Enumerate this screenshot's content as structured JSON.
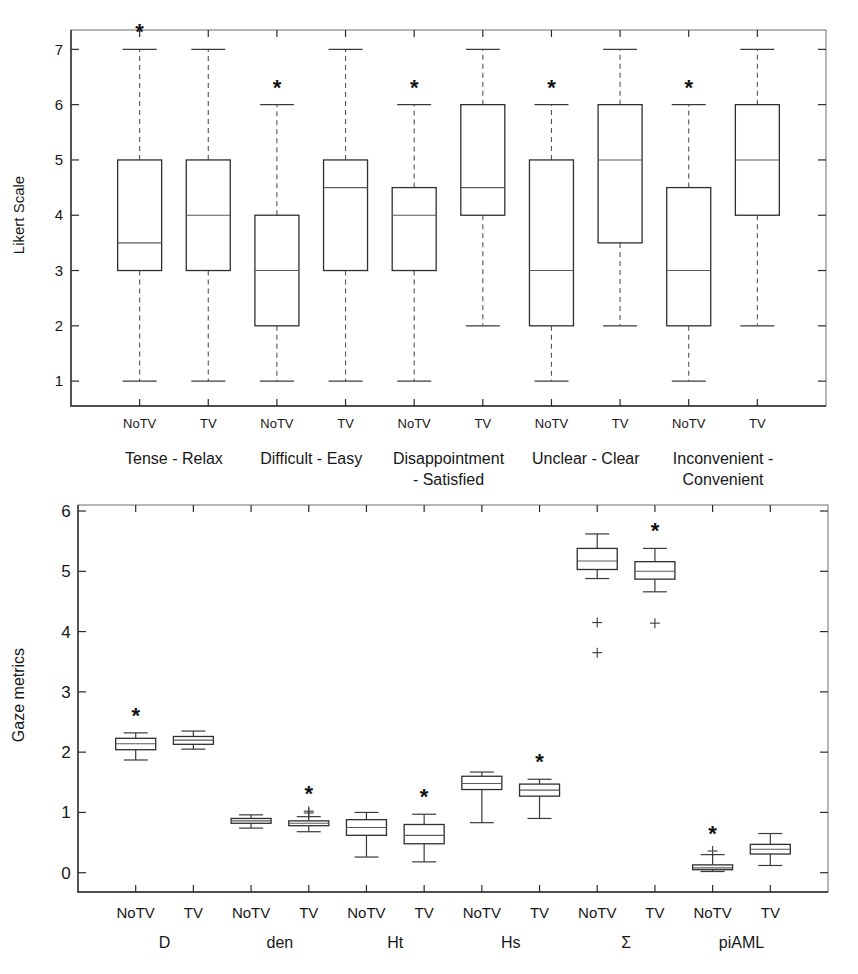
{
  "chart_data": [
    {
      "id": "likert-boxplot",
      "type": "box",
      "title": "",
      "xlabel": "",
      "ylabel": "Likert Scale",
      "ylim": [
        0.55,
        7.35
      ],
      "yticks": [
        1,
        2,
        3,
        4,
        5,
        6,
        7
      ],
      "ytick_labels": [
        "1",
        "2",
        "3",
        "4",
        "5",
        "6",
        "7"
      ],
      "grid": false,
      "legend": "none",
      "condition_labels": [
        "NoTV",
        "TV"
      ],
      "groups": [
        {
          "name": "Tense - Relax",
          "label_lines": [
            "Tense - Relax"
          ],
          "boxes": [
            {
              "condition": "NoTV",
              "whisker_low": 1,
              "q1": 3,
              "median": 3.5,
              "q3": 5,
              "whisker_high": 7,
              "outliers": [],
              "significant": true
            },
            {
              "condition": "TV",
              "whisker_low": 1,
              "q1": 3,
              "median": 4,
              "q3": 5,
              "whisker_high": 7,
              "outliers": [],
              "significant": false
            }
          ]
        },
        {
          "name": "Difficult - Easy",
          "label_lines": [
            "Difficult - Easy"
          ],
          "boxes": [
            {
              "condition": "NoTV",
              "whisker_low": 1,
              "q1": 2,
              "median": 3,
              "q3": 4,
              "whisker_high": 6,
              "outliers": [],
              "significant": true
            },
            {
              "condition": "TV",
              "whisker_low": 1,
              "q1": 3,
              "median": 4.5,
              "q3": 5,
              "whisker_high": 7,
              "outliers": [],
              "significant": false
            }
          ]
        },
        {
          "name": "Disappointment - Satisfied",
          "label_lines": [
            "Disappointment",
            "- Satisfied"
          ],
          "boxes": [
            {
              "condition": "NoTV",
              "whisker_low": 1,
              "q1": 3,
              "median": 4,
              "q3": 4.5,
              "whisker_high": 6,
              "outliers": [],
              "significant": true
            },
            {
              "condition": "TV",
              "whisker_low": 2,
              "q1": 4,
              "median": 4.5,
              "q3": 6,
              "whisker_high": 7,
              "outliers": [],
              "significant": false
            }
          ]
        },
        {
          "name": "Unclear - Clear",
          "label_lines": [
            "Unclear - Clear"
          ],
          "boxes": [
            {
              "condition": "NoTV",
              "whisker_low": 1,
              "q1": 2,
              "median": 3,
              "q3": 5,
              "whisker_high": 6,
              "outliers": [],
              "significant": true
            },
            {
              "condition": "TV",
              "whisker_low": 2,
              "q1": 3.5,
              "median": 5,
              "q3": 6,
              "whisker_high": 7,
              "outliers": [],
              "significant": false
            }
          ]
        },
        {
          "name": "Inconvenient - Convenient",
          "label_lines": [
            "Inconvenient -",
            "Convenient"
          ],
          "boxes": [
            {
              "condition": "NoTV",
              "whisker_low": 1,
              "q1": 2,
              "median": 3,
              "q3": 4.5,
              "whisker_high": 6,
              "outliers": [],
              "significant": true
            },
            {
              "condition": "TV",
              "whisker_low": 2,
              "q1": 4,
              "median": 5,
              "q3": 6,
              "whisker_high": 7,
              "outliers": [],
              "significant": false
            }
          ]
        }
      ]
    },
    {
      "id": "gaze-metrics-boxplot",
      "type": "box",
      "title": "",
      "xlabel": "",
      "ylabel": "Gaze metrics",
      "ylim": [
        -0.32,
        6.1
      ],
      "yticks": [
        0,
        1,
        2,
        3,
        4,
        5,
        6
      ],
      "ytick_labels": [
        "0",
        "1",
        "2",
        "3",
        "4",
        "5",
        "6"
      ],
      "grid": false,
      "legend": "none",
      "condition_labels": [
        "NoTV",
        "TV"
      ],
      "groups": [
        {
          "name": "D",
          "label_lines": [
            "D"
          ],
          "boxes": [
            {
              "condition": "NoTV",
              "whisker_low": 1.87,
              "q1": 2.04,
              "median": 2.14,
              "q3": 2.23,
              "whisker_high": 2.32,
              "outliers": [],
              "significant": true
            },
            {
              "condition": "TV",
              "whisker_low": 2.05,
              "q1": 2.13,
              "median": 2.2,
              "q3": 2.26,
              "whisker_high": 2.35,
              "outliers": [],
              "significant": false
            }
          ]
        },
        {
          "name": "den",
          "label_lines": [
            "den"
          ],
          "boxes": [
            {
              "condition": "NoTV",
              "whisker_low": 0.74,
              "q1": 0.82,
              "median": 0.86,
              "q3": 0.9,
              "whisker_high": 0.96,
              "outliers": [],
              "significant": false
            },
            {
              "condition": "TV",
              "whisker_low": 0.68,
              "q1": 0.78,
              "median": 0.82,
              "q3": 0.86,
              "whisker_high": 0.93,
              "outliers": [
                0.99,
                1.02
              ],
              "significant": true
            }
          ]
        },
        {
          "name": "Ht",
          "label_lines": [
            "Ht"
          ],
          "boxes": [
            {
              "condition": "NoTV",
              "whisker_low": 0.26,
              "q1": 0.62,
              "median": 0.75,
              "q3": 0.88,
              "whisker_high": 1.0,
              "outliers": [],
              "significant": false
            },
            {
              "condition": "TV",
              "whisker_low": 0.18,
              "q1": 0.48,
              "median": 0.62,
              "q3": 0.8,
              "whisker_high": 0.97,
              "outliers": [],
              "significant": true
            }
          ]
        },
        {
          "name": "Hs",
          "label_lines": [
            "Hs"
          ],
          "boxes": [
            {
              "condition": "NoTV",
              "whisker_low": 0.83,
              "q1": 1.38,
              "median": 1.48,
              "q3": 1.6,
              "whisker_high": 1.67,
              "outliers": [],
              "significant": false
            },
            {
              "condition": "TV",
              "whisker_low": 0.9,
              "q1": 1.27,
              "median": 1.37,
              "q3": 1.47,
              "whisker_high": 1.55,
              "outliers": [],
              "significant": true
            }
          ]
        },
        {
          "name": "Sigma",
          "label_lines": [
            "Σ"
          ],
          "boxes": [
            {
              "condition": "NoTV",
              "whisker_low": 4.88,
              "q1": 5.03,
              "median": 5.17,
              "q3": 5.38,
              "whisker_high": 5.62,
              "outliers": [
                4.15,
                3.65
              ],
              "significant": false
            },
            {
              "condition": "TV",
              "whisker_low": 4.66,
              "q1": 4.87,
              "median": 5.0,
              "q3": 5.16,
              "whisker_high": 5.38,
              "outliers": [
                4.14
              ],
              "significant": true
            }
          ]
        },
        {
          "name": "piAML",
          "label_lines": [
            "piAML"
          ],
          "boxes": [
            {
              "condition": "NoTV",
              "whisker_low": 0.02,
              "q1": 0.05,
              "median": 0.08,
              "q3": 0.13,
              "whisker_high": 0.3,
              "outliers": [
                0.36
              ],
              "significant": true
            },
            {
              "condition": "TV",
              "whisker_low": 0.12,
              "q1": 0.31,
              "median": 0.39,
              "q3": 0.47,
              "whisker_high": 0.65,
              "outliers": [],
              "significant": false
            }
          ]
        }
      ]
    }
  ],
  "annotations": {
    "significance_marker": "*"
  },
  "colors": {
    "axis": "#2b2b2b",
    "box_stroke": "#2f2f2f",
    "median": "#5a5a5a",
    "whisker": "#545454",
    "background": "#ffffff"
  }
}
